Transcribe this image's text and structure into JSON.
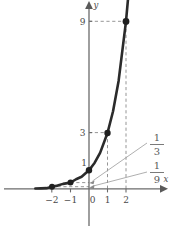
{
  "figure": {
    "axes": {
      "x_axis_label": "x",
      "y_axis_label": "y"
    }
  },
  "chart_data": {
    "type": "line",
    "title": "",
    "subtitle": "",
    "xlabel": "x",
    "ylabel": "y",
    "xlim": [
      -2.9,
      2.55
    ],
    "ylim": [
      -1.1,
      10.4
    ],
    "grid": false,
    "legend": null,
    "function": "y = 3^x",
    "series": [
      {
        "name": "y = 3^x",
        "color": "#2b2b2b",
        "x": [
          -2.9,
          -2.6,
          -2.3,
          -2,
          -1.7,
          -1.4,
          -1,
          -0.7,
          -0.4,
          0,
          0.3,
          0.6,
          1,
          1.3,
          1.6,
          2,
          2.2
        ],
        "y": [
          0.0142,
          0.0222,
          0.0344,
          0.1111,
          0.1715,
          0.2646,
          0.3333,
          0.5133,
          0.6444,
          1,
          1.3904,
          1.9332,
          3,
          4.1716,
          5.7995,
          9,
          11.212
        ]
      }
    ],
    "points": [
      {
        "label": "(-2, 1/9)",
        "x": -2,
        "y": 0.1111
      },
      {
        "label": "(-1, 1/3)",
        "x": -1,
        "y": 0.3333
      },
      {
        "label": "(0, 1)",
        "x": 0,
        "y": 1
      },
      {
        "label": "(1, 3)",
        "x": 1,
        "y": 3
      },
      {
        "label": "(2, 9)",
        "x": 2,
        "y": 9
      }
    ],
    "x_ticks": [
      {
        "value": -2,
        "label": "−2"
      },
      {
        "value": -1,
        "label": "−1"
      },
      {
        "value": 0,
        "label": "0"
      },
      {
        "value": 1,
        "label": "1"
      },
      {
        "value": 2,
        "label": "2"
      }
    ],
    "y_ticks": [
      {
        "value": 1,
        "label": "1"
      },
      {
        "value": 3,
        "label": "3"
      },
      {
        "value": 9,
        "label": "9"
      }
    ],
    "annotations": [
      {
        "name": "fraction-one-third",
        "numerator": "1",
        "denominator": "3",
        "points_to_x": -1,
        "points_to_y": 0.3333
      },
      {
        "name": "fraction-one-ninth",
        "numerator": "1",
        "denominator": "9",
        "points_to_x": -2,
        "points_to_y": 0.1111
      }
    ],
    "guide_lines": [
      {
        "from": [
          1,
          0
        ],
        "to": [
          1,
          3
        ],
        "style": "dashed"
      },
      {
        "from": [
          0,
          3
        ],
        "to": [
          1,
          3
        ],
        "style": "dashed"
      },
      {
        "from": [
          2,
          0
        ],
        "to": [
          2,
          9
        ],
        "style": "dashed"
      },
      {
        "from": [
          0,
          9
        ],
        "to": [
          2,
          9
        ],
        "style": "dashed"
      },
      {
        "from": [
          -2,
          0.1111
        ],
        "to": [
          0,
          0.1111
        ],
        "style": "dashed"
      },
      {
        "from": [
          -1,
          0.3333
        ],
        "to": [
          0,
          0.3333
        ],
        "style": "dashed"
      }
    ]
  },
  "labels": {
    "x_axis": "x",
    "y_axis": "y",
    "tick_neg2": "−2",
    "tick_neg1": "−1",
    "tick_0": "0",
    "tick_1": "1",
    "tick_2": "2",
    "ytick_1": "1",
    "ytick_3": "3",
    "ytick_9": "9",
    "frac1_num": "1",
    "frac1_den": "3",
    "frac2_num": "1",
    "frac2_den": "9"
  },
  "colors": {
    "curve": "#2b2b2b",
    "axis": "#6b6b6b",
    "dashed_guide": "#8a8a8a",
    "point": "#1f1f1f",
    "text": "#4a4a4a",
    "background": "#ffffff"
  }
}
